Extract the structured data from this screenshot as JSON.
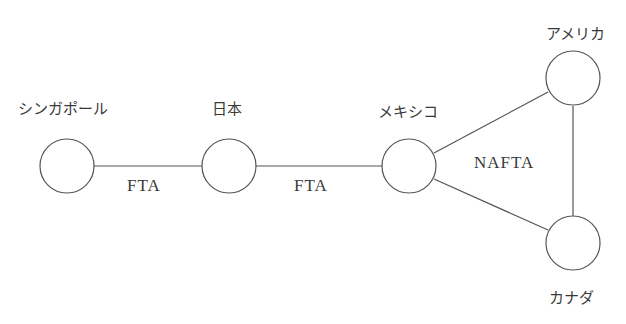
{
  "diagram": {
    "type": "network",
    "nodes": [
      {
        "id": "singapore",
        "label": "シンガポール"
      },
      {
        "id": "japan",
        "label": "日本"
      },
      {
        "id": "mexico",
        "label": "メキシコ"
      },
      {
        "id": "usa",
        "label": "アメリカ"
      },
      {
        "id": "canada",
        "label": "カナダ"
      }
    ],
    "edges": [
      {
        "from": "singapore",
        "to": "japan",
        "label": "FTA"
      },
      {
        "from": "japan",
        "to": "mexico",
        "label": "FTA"
      },
      {
        "from": "mexico",
        "to": "usa",
        "label": ""
      },
      {
        "from": "mexico",
        "to": "canada",
        "label": ""
      },
      {
        "from": "usa",
        "to": "canada",
        "label": ""
      }
    ],
    "group_label": "NAFTA",
    "line_color": "#555555"
  }
}
